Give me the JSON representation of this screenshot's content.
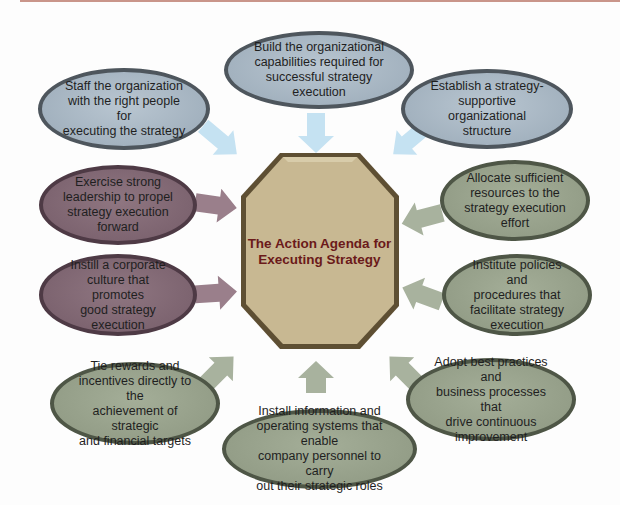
{
  "center": {
    "title": "The Action Agenda for Executing Strategy",
    "fill": "#c8b892",
    "border": "#6a5a3a",
    "text_color": "#6b1a1a"
  },
  "colors": {
    "blue_node": "#a3b2bf",
    "plum_node": "#7d6470",
    "sage_node": "#949e88",
    "blue_arrow": "#c5e2f2",
    "plum_arrow": "#9a7f8b",
    "sage_arrow": "#a8b29e",
    "top_band": "#c9958a"
  },
  "nodes": [
    {
      "id": "build-capabilities",
      "color": "blue",
      "label": "Build the organizational capabilities required for successful strategy execution"
    },
    {
      "id": "staff-organization",
      "color": "blue",
      "label": "Staff the organization with the right people for executing the strategy"
    },
    {
      "id": "establish-structure",
      "color": "blue",
      "label": "Establish a strategy-supportive organizational structure"
    },
    {
      "id": "exercise-leadership",
      "color": "plum",
      "label": "Exercise strong leadership to propel strategy execution forward"
    },
    {
      "id": "allocate-resources",
      "color": "sage",
      "label": "Allocate sufficient resources to the strategy execution effort"
    },
    {
      "id": "instill-culture",
      "color": "plum",
      "label": "Instill a corporate culture that promotes good strategy execution"
    },
    {
      "id": "institute-policies",
      "color": "sage",
      "label": "Institute policies and procedures that facilitate strategy execution"
    },
    {
      "id": "tie-rewards",
      "color": "sage",
      "label": "Tie rewards and incentives directly to the achievement of strategic and financial targets"
    },
    {
      "id": "adopt-best-practices",
      "color": "sage",
      "label": "Adopt best practices and business processes that drive continuous improvement"
    },
    {
      "id": "install-systems",
      "color": "sage",
      "label": "Install information and operating systems that enable company personnel to carry out their strategic roles"
    }
  ],
  "node_lines": {
    "build": [
      "Build the organizational",
      "capabilities required for",
      "successful strategy execution"
    ],
    "staff": [
      "Staff the organization",
      "with the right people for",
      "executing the strategy"
    ],
    "establish": [
      "Establish a strategy-",
      "supportive organizational",
      "structure"
    ],
    "leadership": [
      "Exercise strong",
      "leadership to propel",
      "strategy execution",
      "forward"
    ],
    "allocate": [
      "Allocate sufficient",
      "resources to the",
      "strategy execution",
      "effort"
    ],
    "culture": [
      "Instill a corporate",
      "culture that promotes",
      "good strategy",
      "execution"
    ],
    "policies": [
      "Institute policies and",
      "procedures that",
      "facilitate strategy",
      "execution"
    ],
    "rewards": [
      "Tie rewards and",
      "incentives directly to the",
      "achievement of strategic",
      "and financial targets"
    ],
    "practices": [
      "Adopt best practices and",
      "business processes that",
      "drive continuous",
      "improvement"
    ],
    "systems": [
      "Install information and",
      "operating systems that enable",
      "company personnel to carry",
      "out their strategic roles"
    ]
  }
}
